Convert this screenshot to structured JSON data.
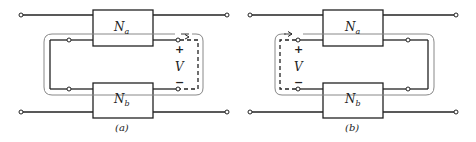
{
  "figure": {
    "panels": [
      {
        "id": "a",
        "caption": "(a)",
        "top_network": "N",
        "top_network_sub": "a",
        "bottom_network": "N",
        "bottom_network_sub": "b",
        "voltage_label": "V",
        "plus_sign": "+",
        "minus_sign": "−",
        "voltage_side": "right"
      },
      {
        "id": "b",
        "caption": "(b)",
        "top_network": "N",
        "top_network_sub": "a",
        "bottom_network": "N",
        "bottom_network_sub": "b",
        "voltage_label": "V",
        "plus_sign": "+",
        "minus_sign": "−",
        "voltage_side": "left"
      }
    ],
    "colors": {
      "wire": "#222222",
      "boundary": "#777777",
      "background": "#ffffff"
    }
  }
}
